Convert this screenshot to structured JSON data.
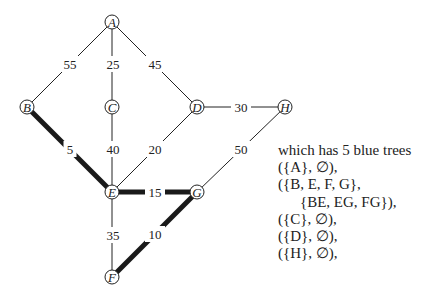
{
  "graph": {
    "nodes": [
      {
        "id": "A",
        "x": 112,
        "y": 22
      },
      {
        "id": "B",
        "x": 27,
        "y": 107
      },
      {
        "id": "C",
        "x": 112,
        "y": 107
      },
      {
        "id": "D",
        "x": 197,
        "y": 107
      },
      {
        "id": "H",
        "x": 285,
        "y": 107
      },
      {
        "id": "E",
        "x": 112,
        "y": 192
      },
      {
        "id": "G",
        "x": 197,
        "y": 192
      },
      {
        "id": "F",
        "x": 112,
        "y": 277
      }
    ],
    "edges": [
      {
        "from": "A",
        "to": "B",
        "weight": "55",
        "bold": false,
        "lx": 70,
        "ly": 64
      },
      {
        "from": "A",
        "to": "C",
        "weight": "25",
        "bold": false,
        "lx": 113,
        "ly": 64
      },
      {
        "from": "A",
        "to": "D",
        "weight": "45",
        "bold": false,
        "lx": 155,
        "ly": 64
      },
      {
        "from": "D",
        "to": "H",
        "weight": "30",
        "bold": false,
        "lx": 241,
        "ly": 107
      },
      {
        "from": "B",
        "to": "E",
        "weight": "5",
        "bold": true,
        "lx": 70,
        "ly": 149
      },
      {
        "from": "C",
        "to": "E",
        "weight": "40",
        "bold": false,
        "lx": 113,
        "ly": 149
      },
      {
        "from": "D",
        "to": "E",
        "weight": "20",
        "bold": false,
        "lx": 155,
        "ly": 149
      },
      {
        "from": "H",
        "to": "G",
        "weight": "50",
        "bold": false,
        "lx": 241,
        "ly": 149
      },
      {
        "from": "E",
        "to": "G",
        "weight": "15",
        "bold": true,
        "lx": 155,
        "ly": 192
      },
      {
        "from": "E",
        "to": "F",
        "weight": "35",
        "bold": false,
        "lx": 113,
        "ly": 235
      },
      {
        "from": "G",
        "to": "F",
        "weight": "10",
        "bold": true,
        "lx": 155,
        "ly": 234
      }
    ]
  },
  "caption": {
    "lines": [
      {
        "text": "which has 5 blue trees",
        "indent": false
      },
      {
        "text": "({A}, ∅),",
        "indent": false
      },
      {
        "text": "({B, E, F, G},",
        "indent": false
      },
      {
        "text": "{BE, EG, FG}),",
        "indent": true
      },
      {
        "text": "({C}, ∅),",
        "indent": false
      },
      {
        "text": "({D}, ∅),",
        "indent": false
      },
      {
        "text": "({H}, ∅),",
        "indent": false
      }
    ]
  }
}
